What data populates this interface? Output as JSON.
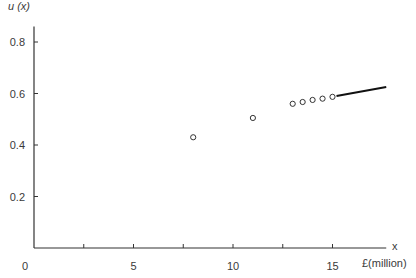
{
  "chart_data": {
    "type": "scatter",
    "title": "",
    "xlabel": "x",
    "xlabel_unit": "£(million)",
    "ylabel": "u (x)",
    "xlim": [
      0,
      17.7
    ],
    "ylim": [
      0,
      0.86
    ],
    "x_ticks": [
      0,
      2.5,
      5,
      7.5,
      10,
      12.5,
      15
    ],
    "x_tick_labels": [
      "0",
      "",
      "5",
      "",
      "10",
      "",
      "15"
    ],
    "y_ticks": [
      0.2,
      0.4,
      0.6,
      0.8
    ],
    "y_tick_labels": [
      "0.2",
      "0.4",
      "0.6",
      "0.8"
    ],
    "grid": false,
    "legend": null,
    "series": [
      {
        "name": "utility points",
        "marker": "open-circle",
        "x": [
          8,
          11,
          13,
          13.5,
          14,
          14.5,
          15
        ],
        "y": [
          0.43,
          0.505,
          0.56,
          0.567,
          0.575,
          0.58,
          0.587
        ]
      },
      {
        "name": "utility line",
        "marker": "line",
        "x": [
          15.2,
          17.7
        ],
        "y": [
          0.59,
          0.625
        ]
      }
    ]
  },
  "labels": {
    "y_axis": "u (x)",
    "x_axis": "x",
    "x_unit": "£(million)",
    "origin": "0"
  }
}
